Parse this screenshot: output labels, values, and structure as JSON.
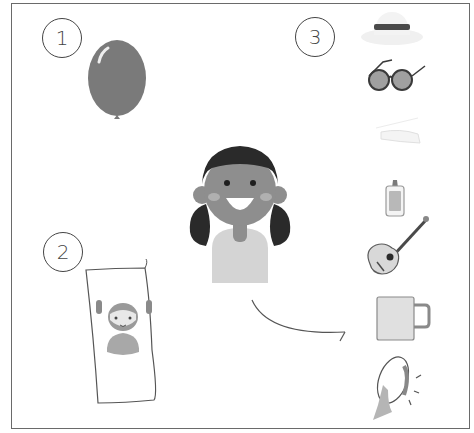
{
  "markers": [
    {
      "label": "1",
      "item": "balloon"
    },
    {
      "label": "2",
      "item": "drawing-of-girl"
    },
    {
      "label": "3",
      "item": "item-options"
    }
  ],
  "center_figure": "smiling-girl",
  "options": [
    "hat",
    "sunglasses",
    "hairpin",
    "glue-bottle",
    "guitar",
    "mug",
    "tambourine"
  ],
  "colors": {
    "balloon": "#7a7a7a",
    "hair": "#2a2a2a",
    "skin": "#8e8e8e",
    "shirt": "#d0d0d0",
    "outline": "#555555"
  }
}
